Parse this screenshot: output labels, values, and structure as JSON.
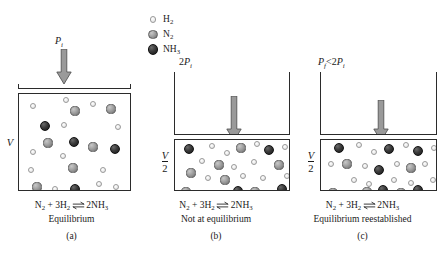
{
  "figure": {
    "topic": "Le Chatelier's principle: effect of volume/pressure change on the Haber process equilibrium"
  },
  "legend": {
    "items": [
      {
        "key": "h2",
        "label": "H",
        "sub": "2",
        "icon": "small-light-sphere-icon",
        "color": "#e8e8e8",
        "radius_px": 3.2
      },
      {
        "key": "n2",
        "label": "N",
        "sub": "2",
        "icon": "medium-gray-sphere-icon",
        "color": "#8d8d8d",
        "radius_px": 4.6
      },
      {
        "key": "nh3",
        "label": "NH",
        "sub": "3",
        "icon": "large-dark-sphere-icon",
        "color": "#2a2a2a",
        "radius_px": 5.4
      }
    ]
  },
  "equation": {
    "reactant_n": "N",
    "reactant_n_sub": "2",
    "plus": "+",
    "reactant_h_coeff": "3H",
    "reactant_h_sub": "2",
    "product_coeff": "2NH",
    "product_sub": "3",
    "arrow_icon": "equilibrium-double-arrow-icon"
  },
  "panels": [
    {
      "id": "a",
      "letter": "(a)",
      "pressure": {
        "symbol": "P",
        "sub": "i",
        "prefix": "",
        "relation": ""
      },
      "pressure_text": "P_i",
      "volume_label": {
        "type": "plain",
        "numerator": "V",
        "denominator": ""
      },
      "state_text": "Equilibrium",
      "arrow_icon": "down-arrow-icon",
      "molecules": [
        {
          "t": "h2",
          "x": 14,
          "y": 12
        },
        {
          "t": "h2",
          "x": 47,
          "y": 6
        },
        {
          "t": "n2",
          "x": 56,
          "y": 17
        },
        {
          "t": "h2",
          "x": 74,
          "y": 10
        },
        {
          "t": "n2",
          "x": 92,
          "y": 15
        },
        {
          "t": "nh3",
          "x": 26,
          "y": 32
        },
        {
          "t": "h2",
          "x": 45,
          "y": 31
        },
        {
          "t": "h2",
          "x": 99,
          "y": 33
        },
        {
          "t": "n2",
          "x": 29,
          "y": 49
        },
        {
          "t": "nh3",
          "x": 55,
          "y": 48
        },
        {
          "t": "n2",
          "x": 74,
          "y": 53
        },
        {
          "t": "nh3",
          "x": 96,
          "y": 55
        },
        {
          "t": "h2",
          "x": 14,
          "y": 58
        },
        {
          "t": "h2",
          "x": 44,
          "y": 62
        },
        {
          "t": "h2",
          "x": 12,
          "y": 76
        },
        {
          "t": "n2",
          "x": 54,
          "y": 74
        },
        {
          "t": "h2",
          "x": 84,
          "y": 76
        },
        {
          "t": "n2",
          "x": 18,
          "y": 93
        },
        {
          "t": "h2",
          "x": 36,
          "y": 95
        },
        {
          "t": "nh3",
          "x": 56,
          "y": 95
        },
        {
          "t": "h2",
          "x": 80,
          "y": 90
        },
        {
          "t": "h2",
          "x": 97,
          "y": 93
        },
        {
          "t": "nh3",
          "x": 16,
          "y": 108
        }
      ]
    },
    {
      "id": "b",
      "letter": "(b)",
      "pressure": {
        "symbol": "P",
        "sub": "i",
        "prefix": "2",
        "relation": ""
      },
      "pressure_text": "2P_i",
      "volume_label": {
        "type": "fraction",
        "numerator": "V",
        "denominator": "2"
      },
      "state_text": "Not at equilibrium",
      "arrow_icon": "down-arrow-icon",
      "molecules": [
        {
          "t": "nh3",
          "x": 14,
          "y": 9
        },
        {
          "t": "h2",
          "x": 37,
          "y": 6
        },
        {
          "t": "h2",
          "x": 52,
          "y": 13
        },
        {
          "t": "n2",
          "x": 66,
          "y": 8
        },
        {
          "t": "h2",
          "x": 82,
          "y": 4
        },
        {
          "t": "nh3",
          "x": 94,
          "y": 10
        },
        {
          "t": "h2",
          "x": 110,
          "y": 7
        },
        {
          "t": "h2",
          "x": 27,
          "y": 21
        },
        {
          "t": "n2",
          "x": 44,
          "y": 25
        },
        {
          "t": "h2",
          "x": 59,
          "y": 27
        },
        {
          "t": "h2",
          "x": 79,
          "y": 22
        },
        {
          "t": "n2",
          "x": 104,
          "y": 25
        },
        {
          "t": "n2",
          "x": 16,
          "y": 33
        },
        {
          "t": "h2",
          "x": 33,
          "y": 38
        },
        {
          "t": "n2",
          "x": 50,
          "y": 40
        },
        {
          "t": "h2",
          "x": 68,
          "y": 36
        },
        {
          "t": "h2",
          "x": 88,
          "y": 38
        },
        {
          "t": "h2",
          "x": 112,
          "y": 36
        },
        {
          "t": "n2",
          "x": 11,
          "y": 52
        },
        {
          "t": "h2",
          "x": 30,
          "y": 53
        },
        {
          "t": "h2",
          "x": 47,
          "y": 55
        },
        {
          "t": "nh3",
          "x": 63,
          "y": 51
        },
        {
          "t": "n2",
          "x": 80,
          "y": 52
        },
        {
          "t": "h2",
          "x": 95,
          "y": 55
        },
        {
          "t": "nh3",
          "x": 107,
          "y": 49
        }
      ]
    },
    {
      "id": "c",
      "letter": "(c)",
      "pressure": {
        "symbol": "P",
        "sub": "f",
        "prefix": "",
        "relation": "< 2P_i"
      },
      "pressure_text": "P_f < 2P_i",
      "volume_label": {
        "type": "fraction",
        "numerator": "V",
        "denominator": "2"
      },
      "state_text": "Equilibrium reestablished",
      "arrow_icon": "down-arrow-icon",
      "molecules": [
        {
          "t": "nh3",
          "x": 18,
          "y": 8
        },
        {
          "t": "h2",
          "x": 38,
          "y": 5
        },
        {
          "t": "h2",
          "x": 53,
          "y": 12
        },
        {
          "t": "nh3",
          "x": 68,
          "y": 9
        },
        {
          "t": "h2",
          "x": 85,
          "y": 5
        },
        {
          "t": "nh3",
          "x": 97,
          "y": 11
        },
        {
          "t": "h2",
          "x": 113,
          "y": 8
        },
        {
          "t": "h2",
          "x": 10,
          "y": 24
        },
        {
          "t": "n2",
          "x": 26,
          "y": 24
        },
        {
          "t": "h2",
          "x": 44,
          "y": 26
        },
        {
          "t": "nh3",
          "x": 58,
          "y": 30
        },
        {
          "t": "h2",
          "x": 76,
          "y": 24
        },
        {
          "t": "n2",
          "x": 90,
          "y": 28
        },
        {
          "t": "h2",
          "x": 104,
          "y": 24
        },
        {
          "t": "h2",
          "x": 33,
          "y": 40
        },
        {
          "t": "h2",
          "x": 48,
          "y": 44
        },
        {
          "t": "h2",
          "x": 73,
          "y": 40
        },
        {
          "t": "h2",
          "x": 90,
          "y": 43
        },
        {
          "t": "h2",
          "x": 112,
          "y": 40
        },
        {
          "t": "n2",
          "x": 12,
          "y": 53
        },
        {
          "t": "h2",
          "x": 30,
          "y": 56
        },
        {
          "t": "n2",
          "x": 46,
          "y": 52
        },
        {
          "t": "nh3",
          "x": 62,
          "y": 50
        },
        {
          "t": "n2",
          "x": 80,
          "y": 53
        },
        {
          "t": "nh3",
          "x": 97,
          "y": 50
        },
        {
          "t": "h2",
          "x": 114,
          "y": 55
        }
      ]
    }
  ]
}
